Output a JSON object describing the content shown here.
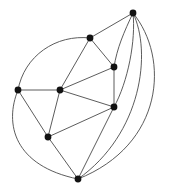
{
  "figure": {
    "type": "graph-diagram",
    "background_color": "#ffffff",
    "width": 173,
    "height": 194
  },
  "style": {
    "edge_color": "#4a4a4a",
    "edge_width": 0.9,
    "vertex_color": "#121212",
    "vertex_radius": 3.4
  },
  "graph_data": {
    "type": "graph",
    "vertex_count": 8,
    "edge_count": 16,
    "vertices": [
      {
        "id": "v1",
        "label": "top",
        "x": 133,
        "y": 13
      },
      {
        "id": "v2",
        "label": "upper-middle",
        "x": 90,
        "y": 38
      },
      {
        "id": "v3",
        "label": "upper-right",
        "x": 114,
        "y": 67
      },
      {
        "id": "v4",
        "label": "left",
        "x": 18,
        "y": 90
      },
      {
        "id": "v5",
        "label": "center",
        "x": 60,
        "y": 90
      },
      {
        "id": "v6",
        "label": "right",
        "x": 114,
        "y": 107
      },
      {
        "id": "v7",
        "label": "lower-left",
        "x": 48,
        "y": 137
      },
      {
        "id": "v8",
        "label": "bottom",
        "x": 78,
        "y": 179
      }
    ],
    "edges": [
      {
        "id": "e1",
        "from": "v1",
        "to": "v2",
        "kind": "straight",
        "path": "M 133 13 L 90 38"
      },
      {
        "id": "e2",
        "from": "v1",
        "to": "v3",
        "kind": "curved",
        "path": "M 133 13 C 124 32 117 48 114 67"
      },
      {
        "id": "e3",
        "from": "v1",
        "to": "v6",
        "kind": "curved",
        "path": "M 133 13 C 136 40 128 82 114 107"
      },
      {
        "id": "e4",
        "from": "v1",
        "to": "v8",
        "kind": "curved",
        "path": "M 133 13 C 152 52 142 134 78 179"
      },
      {
        "id": "e5",
        "from": "v1",
        "to": "v8",
        "kind": "curved",
        "path": "M 133 13 C 170 58 164 145 78 179"
      },
      {
        "id": "e6",
        "from": "v2",
        "to": "v3",
        "kind": "straight",
        "path": "M 90 38 L 114 67"
      },
      {
        "id": "e7",
        "from": "v2",
        "to": "v5",
        "kind": "straight",
        "path": "M 90 38 L 60 90"
      },
      {
        "id": "e8",
        "from": "v2",
        "to": "v4",
        "kind": "curved",
        "path": "M 90 38 C 56 34 24 56 18 90"
      },
      {
        "id": "e9",
        "from": "v3",
        "to": "v5",
        "kind": "straight",
        "path": "M 114 67 L 60 90"
      },
      {
        "id": "e10",
        "from": "v3",
        "to": "v6",
        "kind": "straight",
        "path": "M 114 67 L 114 107"
      },
      {
        "id": "e11",
        "from": "v4",
        "to": "v5",
        "kind": "straight",
        "path": "M 18 90 L 60 90"
      },
      {
        "id": "e12",
        "from": "v4",
        "to": "v7",
        "kind": "straight",
        "path": "M 18 90 L 48 137"
      },
      {
        "id": "e13",
        "from": "v4",
        "to": "v8",
        "kind": "curved",
        "path": "M 18 90 C 4 124 14 166 78 179"
      },
      {
        "id": "e14",
        "from": "v5",
        "to": "v7",
        "kind": "straight",
        "path": "M 60 90 L 48 137"
      },
      {
        "id": "e15",
        "from": "v5",
        "to": "v6",
        "kind": "straight",
        "path": "M 60 90 L 114 107"
      },
      {
        "id": "e16",
        "from": "v6",
        "to": "v7",
        "kind": "straight",
        "path": "M 114 107 L 48 137"
      },
      {
        "id": "e17",
        "from": "v6",
        "to": "v8",
        "kind": "straight",
        "path": "M 114 107 L 78 179"
      },
      {
        "id": "e18",
        "from": "v7",
        "to": "v8",
        "kind": "straight",
        "path": "M 48 137 L 78 179"
      }
    ]
  }
}
